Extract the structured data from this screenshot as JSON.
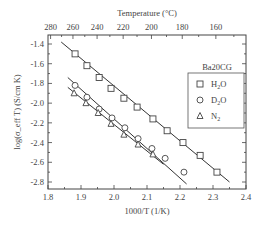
{
  "chart_data": {
    "type": "scatter",
    "title": "",
    "xlabel": "1000/T (1/K)",
    "ylabel": "log(σ_eff T) (S/cm K)",
    "top_xlabel": "Temperature (°C)",
    "xlim": [
      1.8,
      2.4
    ],
    "ylim": [
      -2.9,
      -1.3
    ],
    "x_ticks": [
      1.8,
      1.9,
      2.0,
      2.1,
      2.2,
      2.3,
      2.4
    ],
    "x_tick_labels": [
      "1.8",
      "1.9",
      "2.0",
      "2.1",
      "2.2",
      "2.3",
      "2.4"
    ],
    "y_ticks": [
      -1.4,
      -1.6,
      -1.8,
      -2.0,
      -2.2,
      -2.4,
      -2.6,
      -2.8
    ],
    "y_tick_labels": [
      "-1.4",
      "-1.6",
      "-1.8",
      "-2.0",
      "-2.2",
      "-2.4",
      "-2.6",
      "-2.8"
    ],
    "top_ticks_celsius": [
      280,
      260,
      240,
      220,
      200,
      180,
      160
    ],
    "top_tick_labels": [
      "280",
      "260",
      "240",
      "220",
      "200",
      "180",
      "160"
    ],
    "legend": {
      "title": "Ba20CG",
      "position": "upper right",
      "entries": [
        {
          "label": "H2O",
          "label_main": "H",
          "label_sub": "2",
          "label_end": "O",
          "marker": "square"
        },
        {
          "label": "D2O",
          "label_main": "D",
          "label_sub": "2",
          "label_end": "O",
          "marker": "circle"
        },
        {
          "label": "N2",
          "label_main": "N",
          "label_sub": "2",
          "label_end": "",
          "marker": "triangle"
        }
      ]
    },
    "grid": false,
    "series": [
      {
        "name": "H2O",
        "marker": "square",
        "x": [
          1.882,
          1.918,
          1.955,
          1.991,
          2.03,
          2.07,
          2.118,
          2.161,
          2.209,
          2.261,
          2.312
        ],
        "y": [
          -1.5,
          -1.62,
          -1.74,
          -1.85,
          -1.95,
          -2.04,
          -2.16,
          -2.28,
          -2.4,
          -2.53,
          -2.7
        ],
        "fit_line": {
          "x": [
            1.84,
            2.35
          ],
          "y": [
            -1.38,
            -2.8
          ]
        }
      },
      {
        "name": "D2O",
        "marker": "circle",
        "x": [
          1.882,
          1.918,
          1.955,
          1.994,
          2.033,
          2.073,
          2.115,
          2.155,
          2.212
        ],
        "y": [
          -1.82,
          -1.94,
          -2.06,
          -2.15,
          -2.25,
          -2.36,
          -2.46,
          -2.56,
          -2.7
        ],
        "fit_line": {
          "x": [
            1.86,
            2.22
          ],
          "y": [
            -1.74,
            -2.82
          ]
        }
      },
      {
        "name": "N2",
        "marker": "triangle",
        "x": [
          1.879,
          1.915,
          1.952,
          1.991,
          2.03,
          2.073,
          2.118
        ],
        "y": [
          -1.9,
          -2.0,
          -2.1,
          -2.21,
          -2.32,
          -2.42,
          -2.52
        ],
        "fit_line": {
          "x": [
            1.86,
            2.15
          ],
          "y": [
            -1.84,
            -2.62
          ]
        }
      }
    ]
  }
}
